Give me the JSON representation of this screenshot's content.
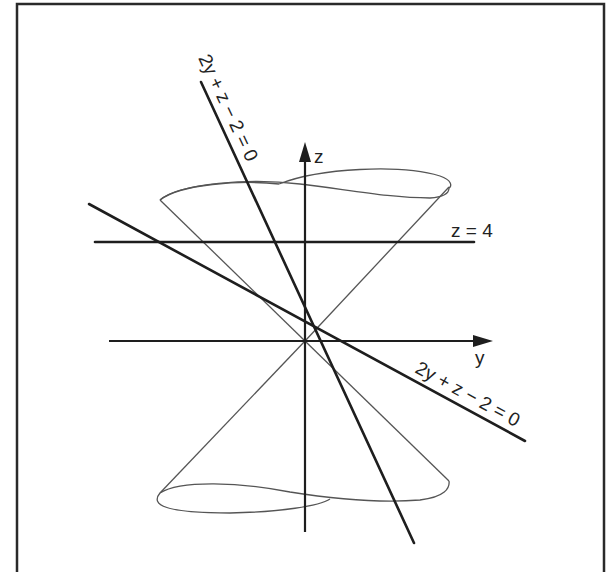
{
  "diagram": {
    "axes": {
      "z_label": "z",
      "y_label": "y"
    },
    "labels": {
      "plane_horizontal": "z = 4",
      "plane_steep": "2y + z − 2 = 0",
      "plane_shallow": "2y + z − 2 = 0"
    },
    "colors": {
      "stroke": "#1e1e1e",
      "cone_stroke": "#555555",
      "background": "#ffffff"
    }
  }
}
